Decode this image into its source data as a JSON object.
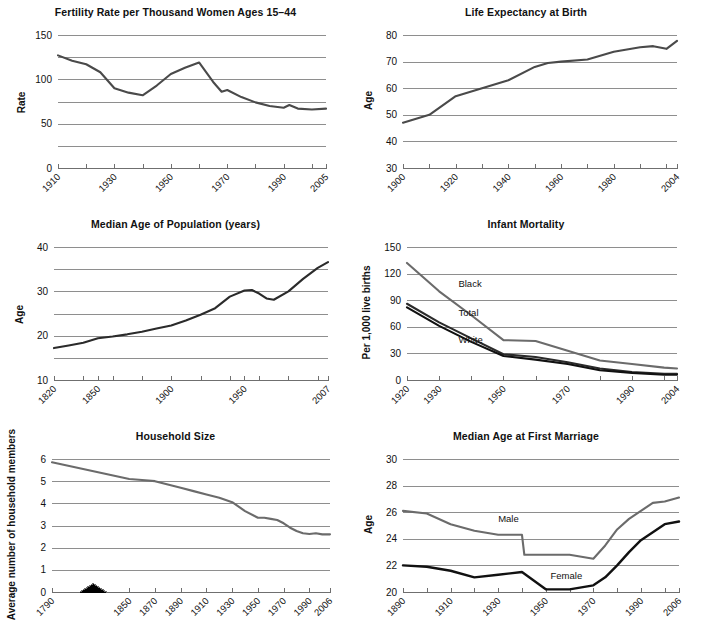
{
  "figure": {
    "panel_count": 6,
    "colors": {
      "dark": "#2b2b2b",
      "black": "#111111",
      "mid_gray": "#6b6b6b",
      "grid": "#8e8e8e",
      "axis": "#6f6f6f",
      "background": "#ffffff"
    }
  },
  "chart_data": [
    {
      "id": "fertility",
      "type": "line",
      "title": "Fertility Rate per Thousand Women Ages 15–44",
      "xlabel": "",
      "ylabel": "Rate",
      "ylim": [
        0,
        150
      ],
      "yticks": [
        0,
        25,
        50,
        75,
        100,
        125,
        150
      ],
      "ytick_labels": [
        "0",
        "",
        "50",
        "",
        "100",
        "",
        "150"
      ],
      "xlim": [
        1910,
        2005
      ],
      "xticks": [
        1910,
        1920,
        1930,
        1940,
        1950,
        1960,
        1970,
        1980,
        1990,
        2000,
        2005
      ],
      "xtick_labels": [
        "1910",
        "",
        "1930",
        "",
        "1950",
        "",
        "1970",
        "",
        "1990",
        "",
        "2005"
      ],
      "grid": true,
      "legend": "none",
      "series": [
        {
          "name": "Fertility rate",
          "color": "#4a4a4a",
          "width": 2.1,
          "x": [
            1910,
            1915,
            1920,
            1925,
            1930,
            1935,
            1940,
            1945,
            1950,
            1955,
            1960,
            1965,
            1968,
            1970,
            1975,
            1980,
            1985,
            1990,
            1992,
            1995,
            2000,
            2005
          ],
          "values": [
            127,
            121,
            117,
            108,
            90,
            85,
            82,
            93,
            106,
            113,
            119,
            97,
            86,
            88,
            80,
            74,
            70,
            68,
            71,
            67,
            66,
            67
          ]
        }
      ]
    },
    {
      "id": "life_expectancy",
      "type": "line",
      "title": "Life Expectancy at Birth",
      "xlabel": "",
      "ylabel": "Age",
      "ylim": [
        30,
        80
      ],
      "yticks": [
        30,
        40,
        50,
        60,
        70,
        80
      ],
      "ytick_labels": [
        "30",
        "40",
        "50",
        "60",
        "70",
        "80"
      ],
      "xlim": [
        1900,
        2004
      ],
      "xticks": [
        1900,
        1910,
        1920,
        1930,
        1940,
        1950,
        1960,
        1970,
        1980,
        1990,
        2000,
        2004
      ],
      "xtick_labels": [
        "1900",
        "",
        "1920",
        "",
        "1940",
        "",
        "1960",
        "",
        "1980",
        "",
        "",
        "2004"
      ],
      "grid": true,
      "legend": "none",
      "series": [
        {
          "name": "Life expectancy",
          "color": "#4a4a4a",
          "width": 2.1,
          "x": [
            1900,
            1905,
            1910,
            1920,
            1930,
            1940,
            1950,
            1955,
            1960,
            1970,
            1980,
            1990,
            1995,
            2000,
            2004
          ],
          "values": [
            47,
            48.5,
            50,
            57,
            60,
            63,
            68,
            69.5,
            70,
            70.8,
            73.7,
            75.4,
            75.8,
            74.8,
            77.8
          ]
        }
      ]
    },
    {
      "id": "median_age_population",
      "type": "line",
      "title": "Median Age of Population (years)",
      "xlabel": "",
      "ylabel": "Age",
      "ylim": [
        10,
        40
      ],
      "yticks": [
        10,
        15,
        20,
        25,
        30,
        35,
        40
      ],
      "ytick_labels": [
        "10",
        "",
        "20",
        "",
        "30",
        "",
        "40"
      ],
      "xlim": [
        1820,
        2007
      ],
      "xticks": [
        1820,
        1840,
        1850,
        1860,
        1880,
        1900,
        1920,
        1940,
        1950,
        1960,
        1980,
        2000,
        2007
      ],
      "xtick_labels": [
        "1820",
        "",
        "1850",
        "",
        "",
        "1900",
        "",
        "",
        "1950",
        "",
        "",
        "",
        "2007"
      ],
      "grid": true,
      "legend": "none",
      "series": [
        {
          "name": "Median age",
          "color": "#2b2b2b",
          "width": 2.1,
          "x": [
            1820,
            1830,
            1840,
            1850,
            1860,
            1870,
            1880,
            1890,
            1900,
            1910,
            1920,
            1930,
            1940,
            1950,
            1955,
            1960,
            1965,
            1970,
            1980,
            1990,
            2000,
            2007
          ],
          "values": [
            17.2,
            17.8,
            18.4,
            19.4,
            19.8,
            20.3,
            20.9,
            21.6,
            22.3,
            23.4,
            24.7,
            26.2,
            28.8,
            30.2,
            30.3,
            29.5,
            28.4,
            28.1,
            30.0,
            32.8,
            35.3,
            36.6
          ]
        }
      ]
    },
    {
      "id": "infant_mortality",
      "type": "line",
      "title": "Infant Mortality",
      "xlabel": "",
      "ylabel": "Per 1,000 live births",
      "ylim": [
        0,
        150
      ],
      "yticks": [
        0,
        30,
        60,
        90,
        120,
        150
      ],
      "ytick_labels": [
        "0",
        "30",
        "60",
        "90",
        "120",
        "150"
      ],
      "xlim": [
        1920,
        2004
      ],
      "xticks": [
        1920,
        1930,
        1940,
        1950,
        1960,
        1970,
        1980,
        1990,
        2000,
        2004
      ],
      "xtick_labels": [
        "1920",
        "1930",
        "",
        "1950",
        "",
        "1970",
        "",
        "1990",
        "",
        "2004"
      ],
      "grid": true,
      "legend": "inline-labels",
      "series": [
        {
          "name": "Black",
          "label": "Black",
          "color": "#6b6b6b",
          "width": 2.1,
          "label_x": 1936,
          "label_y": 105,
          "x": [
            1920,
            1930,
            1940,
            1950,
            1960,
            1970,
            1980,
            1990,
            2000,
            2004
          ],
          "values": [
            132,
            100,
            73,
            45,
            44,
            33,
            22,
            18,
            14,
            13
          ]
        },
        {
          "name": "Total",
          "label": "Total",
          "color": "#2b2b2b",
          "width": 2.1,
          "label_x": 1936,
          "label_y": 72,
          "x": [
            1920,
            1930,
            1940,
            1950,
            1960,
            1970,
            1980,
            1990,
            2000,
            2004
          ],
          "values": [
            86,
            65,
            47,
            29,
            26,
            20,
            13,
            9,
            7,
            7
          ]
        },
        {
          "name": "White",
          "label": "White",
          "color": "#111111",
          "width": 2.1,
          "label_x": 1936,
          "label_y": 42,
          "x": [
            1920,
            1930,
            1940,
            1950,
            1960,
            1970,
            1980,
            1990,
            2000,
            2004
          ],
          "values": [
            82,
            61,
            43,
            27,
            23,
            18,
            11,
            8,
            6,
            6
          ]
        }
      ]
    },
    {
      "id": "household_size",
      "type": "line",
      "title": "Household Size",
      "xlabel": "",
      "ylabel": "Average number of household members",
      "ylim": [
        0,
        6
      ],
      "yticks": [
        0,
        1,
        2,
        3,
        4,
        5,
        6
      ],
      "ytick_labels": [
        "0",
        "1",
        "2",
        "3",
        "4",
        "5",
        "6"
      ],
      "xlim": [
        1790,
        2006
      ],
      "axis_break": true,
      "xticks": [
        1790,
        1850,
        1870,
        1890,
        1910,
        1930,
        1950,
        1970,
        1990,
        2006
      ],
      "xtick_labels": [
        "1790",
        "1850",
        "1870",
        "1890",
        "1910",
        "1930",
        "1950",
        "1970",
        "1990",
        "2006"
      ],
      "grid": true,
      "legend": "none",
      "series": [
        {
          "name": "Household size",
          "color": "#6b6b6b",
          "width": 2.1,
          "x": [
            1790,
            1850,
            1860,
            1870,
            1880,
            1890,
            1900,
            1910,
            1920,
            1930,
            1940,
            1950,
            1955,
            1960,
            1965,
            1970,
            1975,
            1980,
            1985,
            1990,
            1995,
            2000,
            2006
          ],
          "values": [
            5.85,
            5.1,
            5.05,
            5.0,
            4.85,
            4.7,
            4.55,
            4.4,
            4.25,
            4.05,
            3.65,
            3.35,
            3.35,
            3.3,
            3.25,
            3.1,
            2.9,
            2.75,
            2.65,
            2.62,
            2.65,
            2.6,
            2.6
          ]
        }
      ]
    },
    {
      "id": "median_age_first_marriage",
      "type": "line",
      "title": "Median Age at First Marriage",
      "xlabel": "",
      "ylabel": "Age",
      "ylim": [
        20,
        30
      ],
      "yticks": [
        20,
        22,
        24,
        26,
        28,
        30
      ],
      "ytick_labels": [
        "20",
        "22",
        "24",
        "26",
        "28",
        "30"
      ],
      "xlim": [
        1890,
        2006
      ],
      "xticks": [
        1890,
        1900,
        1910,
        1920,
        1930,
        1940,
        1950,
        1960,
        1970,
        1980,
        1990,
        2000,
        2006
      ],
      "xtick_labels": [
        "1890",
        "",
        "1910",
        "",
        "1930",
        "",
        "1950",
        "",
        "1970",
        "",
        "1990",
        "",
        "2006"
      ],
      "grid": true,
      "legend": "inline-labels",
      "series": [
        {
          "name": "Male",
          "label": "Male",
          "color": "#6b6b6b",
          "width": 2.1,
          "label_x": 1930,
          "label_y": 25.3,
          "x": [
            1890,
            1900,
            1910,
            1920,
            1930,
            1940,
            1941,
            1950,
            1960,
            1970,
            1975,
            1980,
            1985,
            1990,
            1995,
            2000,
            2006
          ],
          "values": [
            26.1,
            25.9,
            25.1,
            24.6,
            24.3,
            24.3,
            22.8,
            22.8,
            22.8,
            22.5,
            23.5,
            24.7,
            25.5,
            26.1,
            26.7,
            26.8,
            27.1
          ]
        },
        {
          "name": "Female",
          "label": "Female",
          "color": "#111111",
          "width": 2.4,
          "label_x": 1952,
          "label_y": 21.0,
          "x": [
            1890,
            1900,
            1910,
            1920,
            1930,
            1940,
            1950,
            1960,
            1970,
            1975,
            1980,
            1985,
            1990,
            1995,
            2000,
            2006
          ],
          "values": [
            22.0,
            21.9,
            21.6,
            21.1,
            21.3,
            21.5,
            20.2,
            20.2,
            20.5,
            21.1,
            22.0,
            23.0,
            23.9,
            24.5,
            25.1,
            25.3
          ]
        }
      ]
    }
  ]
}
